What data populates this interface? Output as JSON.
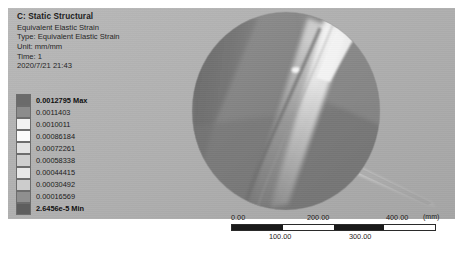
{
  "annotation": {
    "title": "C: Static Structural",
    "lines": [
      "Equivalent Elastic Strain",
      "Type: Equivalent Elastic Strain",
      "Unit: mm/mm",
      "Time: 1",
      "2020/7/21 21:43"
    ]
  },
  "legend": {
    "entries": [
      {
        "label": "0.0012795 Max",
        "color": "#6b6b6b",
        "bold": true
      },
      {
        "label": "0.0011403",
        "color": "#8c8c8c",
        "bold": false
      },
      {
        "label": "0.0010011",
        "color": "#f2f2f2",
        "bold": false
      },
      {
        "label": "0.00086184",
        "color": "#fbfbfb",
        "bold": false
      },
      {
        "label": "0.00072261",
        "color": "#e3e3e3",
        "bold": false
      },
      {
        "label": "0.00058338",
        "color": "#cfcfcf",
        "bold": false
      },
      {
        "label": "0.00044415",
        "color": "#e8e8e8",
        "bold": false
      },
      {
        "label": "0.00030492",
        "color": "#cccccc",
        "bold": false
      },
      {
        "label": "0.00016569",
        "color": "#8f8f8f",
        "bold": false
      },
      {
        "label": "2.6456e-5 Min",
        "color": "#5e5e5e",
        "bold": true
      }
    ]
  },
  "ruler": {
    "major_ticks": [
      "0.00",
      "200.00",
      "400.00"
    ],
    "minor_ticks": [
      "100.00",
      "300.00"
    ],
    "unit": "(mm)",
    "segments": [
      "dark",
      "light",
      "dark",
      "light"
    ]
  },
  "colors": {
    "viewport_background": "#b3b3b3",
    "text": "#1c1c1c",
    "ruler_dark": "#1a1a1a",
    "ruler_light": "#ffffff"
  }
}
